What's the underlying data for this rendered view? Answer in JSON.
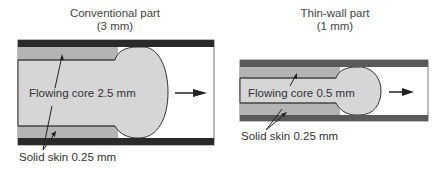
{
  "left_panel": {
    "title_line1": "Conventional part",
    "title_line2": "(3 mm)",
    "core_label": "Flowing core 2.5 mm",
    "skin_label": "Solid skin 0.25 mm"
  },
  "right_panel": {
    "title_line1": "Thin-wall part",
    "title_line2": "(1 mm)",
    "core_label": "Flowing core 0.5 mm",
    "skin_label": "Solid skin 0.25 mm"
  },
  "colors": {
    "mold_wall_left": "#2a2a2a",
    "mold_wall_right": "#5a5a5a",
    "solid_skin": "#b4b4b4",
    "flowing_core": "#d6d6d6",
    "cavity": "#ffffff",
    "outline": "#333333"
  },
  "icons": {
    "flow_direction": "arrow-right-icon"
  }
}
